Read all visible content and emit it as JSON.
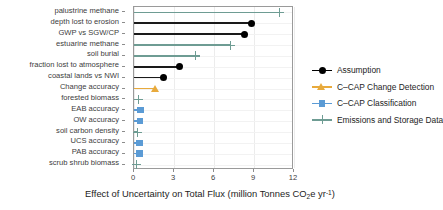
{
  "chart_data": {
    "type": "bar",
    "orientation": "horizontal",
    "title": "",
    "xlabel": "Effect of Uncertainty on Total Flux (million Tonnes CO2e yr-1)",
    "xlabel_parts": {
      "pre": "Effect of Uncertainty on Total Flux (million Tonnes CO",
      "sub": "2",
      "mid": "e yr",
      "sup": "-1",
      "post": ")"
    },
    "ylabel": "",
    "xlim": [
      0,
      12
    ],
    "xticks": [
      0,
      3,
      6,
      9,
      12
    ],
    "xticklabels": [
      "0",
      "3",
      "6",
      "9",
      "12"
    ],
    "grid": true,
    "legend_position": "right",
    "categories": [
      "palustrine methane",
      "depth lost to erosion",
      "GWP vs SGW/CP",
      "estuarine methane",
      "soil burial",
      "fraction lost to atmosphere",
      "coastal lands vs NWI",
      "Change accuracy",
      "forested biomass",
      "EAB accuracy",
      "OW accuracy",
      "soil carbon density",
      "UCS accuracy",
      "PAB accuracy",
      "scrub shrub biomass"
    ],
    "values": [
      10.9,
      8.8,
      8.3,
      7.2,
      4.6,
      3.4,
      2.2,
      1.6,
      0.3,
      0.5,
      0.45,
      0.25,
      0.4,
      0.4,
      0.2
    ],
    "groups": [
      "Emissions and Storage Data",
      "Assumption",
      "Assumption",
      "Emissions and Storage Data",
      "Emissions and Storage Data",
      "Assumption",
      "Assumption",
      "C-CAP Change Detection",
      "Emissions and Storage Data",
      "C-CAP Classification",
      "C-CAP Classification",
      "Emissions and Storage Data",
      "C-CAP Classification",
      "C-CAP Classification",
      "Emissions and Storage Data"
    ],
    "series": [
      {
        "name": "Assumption",
        "marker": "circle",
        "color": "#000000",
        "points": [
          {
            "category": "depth lost to erosion",
            "value": 8.8
          },
          {
            "category": "GWP vs SGW/CP",
            "value": 8.3
          },
          {
            "category": "fraction lost to atmosphere",
            "value": 3.4
          },
          {
            "category": "coastal lands vs NWI",
            "value": 2.2
          }
        ]
      },
      {
        "name": "C-CAP Change Detection",
        "marker": "triangle",
        "color": "#e8aa3c",
        "points": [
          {
            "category": "Change accuracy",
            "value": 1.6
          }
        ]
      },
      {
        "name": "C-CAP Classification",
        "marker": "square",
        "color": "#5b9bd5",
        "points": [
          {
            "category": "EAB accuracy",
            "value": 0.5
          },
          {
            "category": "OW accuracy",
            "value": 0.45
          },
          {
            "category": "UCS accuracy",
            "value": 0.4
          },
          {
            "category": "PAB accuracy",
            "value": 0.4
          }
        ]
      },
      {
        "name": "Emissions and Storage Data",
        "marker": "plus",
        "color": "#6e9c93",
        "points": [
          {
            "category": "palustrine methane",
            "value": 10.9
          },
          {
            "category": "estuarine methane",
            "value": 7.2
          },
          {
            "category": "soil burial",
            "value": 4.6
          },
          {
            "category": "forested biomass",
            "value": 0.3
          },
          {
            "category": "soil carbon density",
            "value": 0.25
          },
          {
            "category": "scrub shrub biomass",
            "value": 0.2
          }
        ]
      }
    ]
  },
  "legend": {
    "items": [
      {
        "label": "Assumption",
        "marker": "circle",
        "color": "#000000"
      },
      {
        "label": "C–CAP Change Detection",
        "marker": "triangle",
        "color": "#e8aa3c"
      },
      {
        "label": "C–CAP Classification",
        "marker": "square",
        "color": "#5b9bd5"
      },
      {
        "label": "Emissions and Storage Data",
        "marker": "plus",
        "color": "#6e9c93"
      }
    ]
  }
}
